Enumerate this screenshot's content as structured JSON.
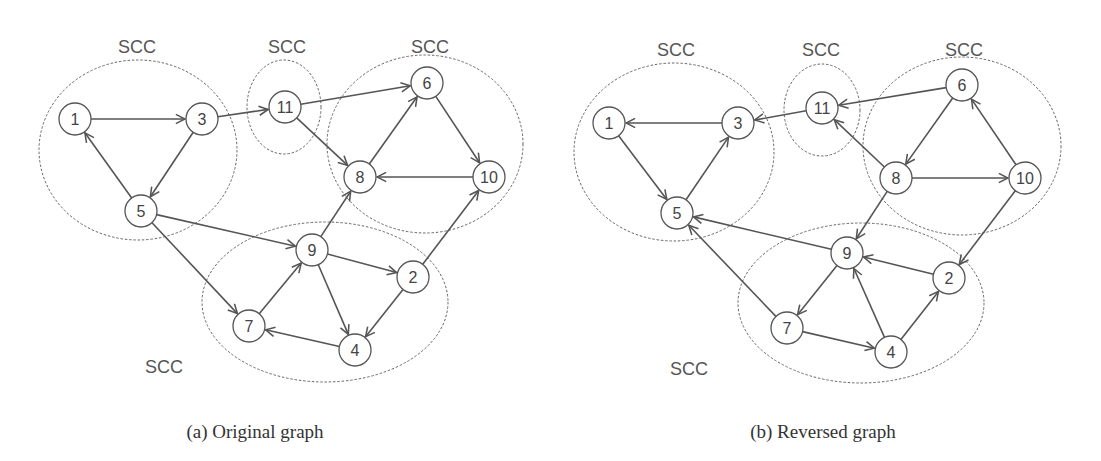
{
  "figure": {
    "panels": [
      {
        "id": "a",
        "caption": "(a)  Original graph",
        "caption_pos": [
          255,
          438
        ],
        "scc_groups": [
          {
            "label": "SCC",
            "label_pos": [
              137,
              53
            ],
            "ellipse": {
              "cx": 138,
              "cy": 150,
              "rx": 99,
              "ry": 90
            },
            "members": [
              "1",
              "3",
              "5"
            ]
          },
          {
            "label": "SCC",
            "label_pos": [
              287,
              53
            ],
            "ellipse": {
              "cx": 284,
              "cy": 107,
              "rx": 37,
              "ry": 47
            },
            "members": [
              "11"
            ]
          },
          {
            "label": "SCC",
            "label_pos": [
              430,
              53
            ],
            "ellipse": {
              "cx": 425,
              "cy": 144,
              "rx": 98,
              "ry": 89
            },
            "members": [
              "6",
              "8",
              "10"
            ]
          },
          {
            "label": "SCC",
            "label_pos": [
              164,
              373
            ],
            "ellipse": {
              "cx": 325,
              "cy": 302,
              "rx": 123,
              "ry": 80
            },
            "members": [
              "9",
              "2",
              "7",
              "4"
            ]
          }
        ],
        "nodes": [
          {
            "id": "1",
            "x": 75,
            "y": 119
          },
          {
            "id": "3",
            "x": 202,
            "y": 119
          },
          {
            "id": "5",
            "x": 141,
            "y": 211
          },
          {
            "id": "11",
            "x": 285,
            "y": 107
          },
          {
            "id": "6",
            "x": 427,
            "y": 83
          },
          {
            "id": "8",
            "x": 360,
            "y": 177
          },
          {
            "id": "10",
            "x": 489,
            "y": 177
          },
          {
            "id": "9",
            "x": 312,
            "y": 250
          },
          {
            "id": "2",
            "x": 413,
            "y": 277
          },
          {
            "id": "7",
            "x": 249,
            "y": 326
          },
          {
            "id": "4",
            "x": 355,
            "y": 350
          }
        ],
        "edges": [
          [
            "1",
            "3"
          ],
          [
            "3",
            "5"
          ],
          [
            "5",
            "1"
          ],
          [
            "3",
            "11"
          ],
          [
            "11",
            "6"
          ],
          [
            "11",
            "8"
          ],
          [
            "6",
            "10"
          ],
          [
            "10",
            "8"
          ],
          [
            "8",
            "6"
          ],
          [
            "5",
            "9"
          ],
          [
            "5",
            "7"
          ],
          [
            "9",
            "8"
          ],
          [
            "9",
            "2"
          ],
          [
            "9",
            "4"
          ],
          [
            "2",
            "10"
          ],
          [
            "2",
            "4"
          ],
          [
            "4",
            "7"
          ],
          [
            "7",
            "9"
          ]
        ]
      },
      {
        "id": "b",
        "caption": "(b)  Reversed graph",
        "caption_pos": [
          823,
          438
        ],
        "scc_groups": [
          {
            "label": "SCC",
            "label_pos": [
              676,
              56
            ],
            "ellipse": {
              "cx": 674,
              "cy": 152,
              "rx": 100,
              "ry": 89
            },
            "members": [
              "1",
              "3",
              "5"
            ]
          },
          {
            "label": "SCC",
            "label_pos": [
              821,
              56
            ],
            "ellipse": {
              "cx": 822,
              "cy": 110,
              "rx": 38,
              "ry": 46
            },
            "members": [
              "11"
            ]
          },
          {
            "label": "SCC",
            "label_pos": [
              964,
              56
            ],
            "ellipse": {
              "cx": 962,
              "cy": 146,
              "rx": 99,
              "ry": 89
            },
            "members": [
              "6",
              "8",
              "10"
            ]
          },
          {
            "label": "SCC",
            "label_pos": [
              689,
              375
            ],
            "ellipse": {
              "cx": 861,
              "cy": 303,
              "rx": 123,
              "ry": 80
            },
            "members": [
              "9",
              "2",
              "7",
              "4"
            ]
          }
        ],
        "nodes": [
          {
            "id": "1",
            "x": 609,
            "y": 123
          },
          {
            "id": "3",
            "x": 738,
            "y": 123
          },
          {
            "id": "5",
            "x": 677,
            "y": 213
          },
          {
            "id": "11",
            "x": 822,
            "y": 108
          },
          {
            "id": "6",
            "x": 962,
            "y": 85
          },
          {
            "id": "8",
            "x": 896,
            "y": 178
          },
          {
            "id": "10",
            "x": 1025,
            "y": 178
          },
          {
            "id": "9",
            "x": 847,
            "y": 253
          },
          {
            "id": "2",
            "x": 949,
            "y": 278
          },
          {
            "id": "7",
            "x": 787,
            "y": 328
          },
          {
            "id": "4",
            "x": 891,
            "y": 352
          }
        ],
        "edges": [
          [
            "3",
            "1"
          ],
          [
            "5",
            "3"
          ],
          [
            "1",
            "5"
          ],
          [
            "11",
            "3"
          ],
          [
            "6",
            "11"
          ],
          [
            "8",
            "11"
          ],
          [
            "10",
            "6"
          ],
          [
            "8",
            "10"
          ],
          [
            "6",
            "8"
          ],
          [
            "9",
            "5"
          ],
          [
            "7",
            "5"
          ],
          [
            "8",
            "9"
          ],
          [
            "2",
            "9"
          ],
          [
            "4",
            "9"
          ],
          [
            "10",
            "2"
          ],
          [
            "4",
            "2"
          ],
          [
            "7",
            "4"
          ],
          [
            "9",
            "7"
          ]
        ]
      }
    ],
    "node_radius": 16,
    "colors": {
      "stroke": "#555555",
      "text": "#444444",
      "ellipse": "#666666",
      "background": "#ffffff"
    }
  }
}
